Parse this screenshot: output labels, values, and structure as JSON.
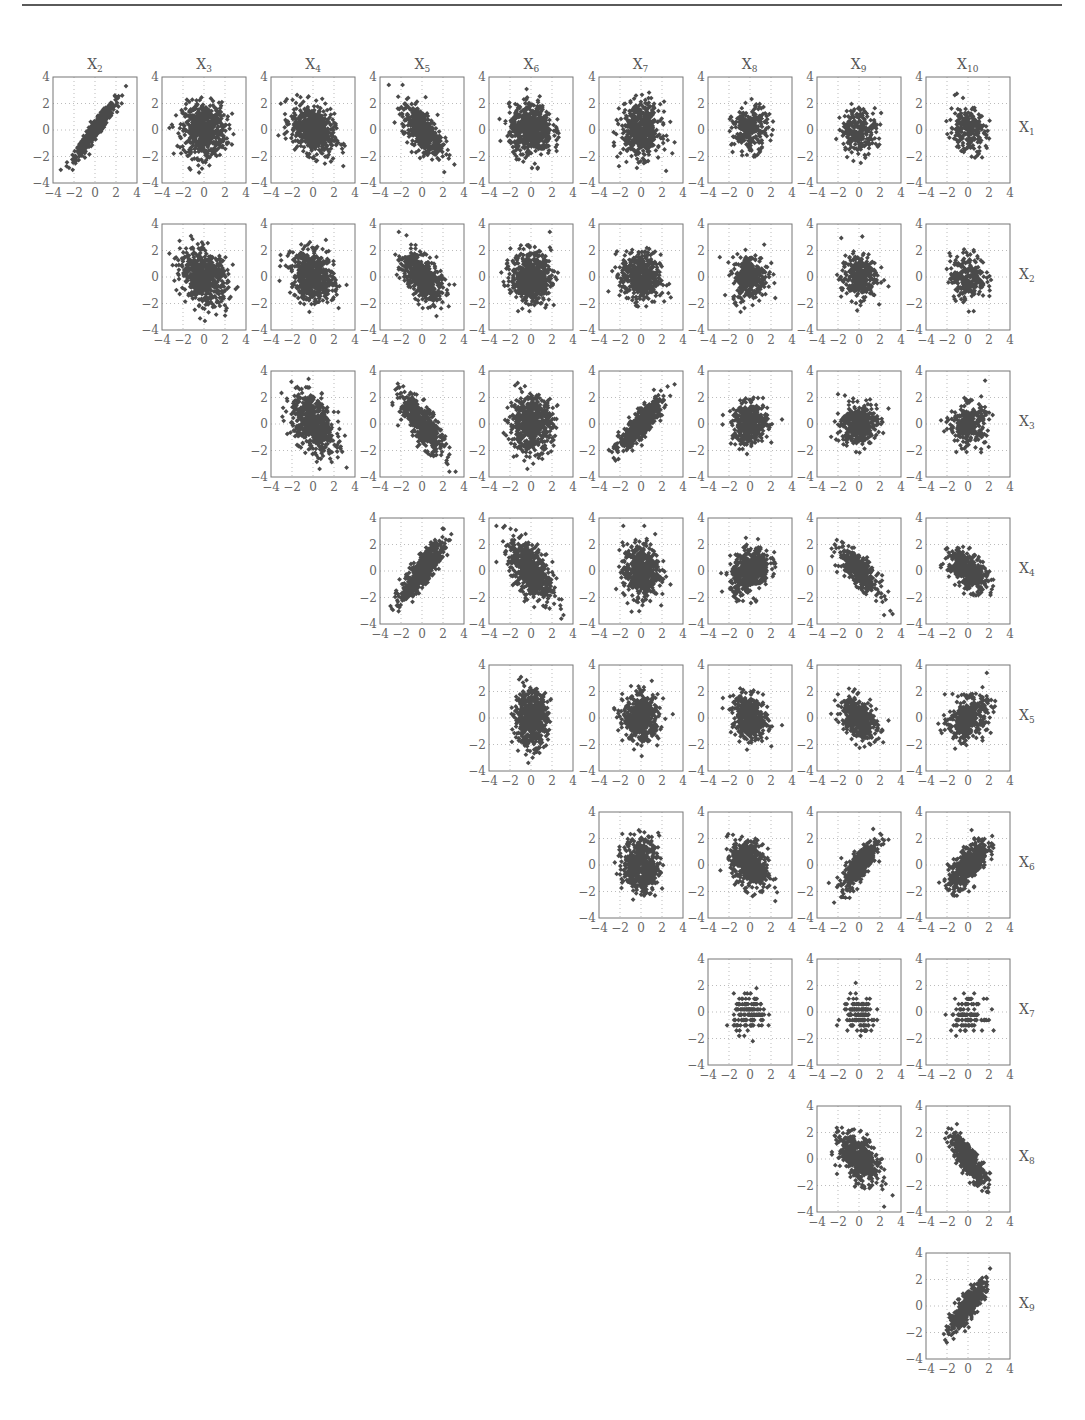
{
  "figure": {
    "type": "scatterplot-matrix",
    "column_titles": [
      {
        "base": "X",
        "sub": "2"
      },
      {
        "base": "X",
        "sub": "3"
      },
      {
        "base": "X",
        "sub": "4"
      },
      {
        "base": "X",
        "sub": "5"
      },
      {
        "base": "X",
        "sub": "6"
      },
      {
        "base": "X",
        "sub": "7"
      },
      {
        "base": "X",
        "sub": "8"
      },
      {
        "base": "X",
        "sub": "9"
      },
      {
        "base": "X",
        "sub": "10"
      }
    ],
    "row_labels": [
      {
        "base": "X",
        "sub": "1"
      },
      {
        "base": "X",
        "sub": "2"
      },
      {
        "base": "X",
        "sub": "3"
      },
      {
        "base": "X",
        "sub": "4"
      },
      {
        "base": "X",
        "sub": "5"
      },
      {
        "base": "X",
        "sub": "6"
      },
      {
        "base": "X",
        "sub": "7"
      },
      {
        "base": "X",
        "sub": "8"
      },
      {
        "base": "X",
        "sub": "9"
      }
    ],
    "axis_ticks": [
      "−4",
      "−2",
      "0",
      "2",
      "4"
    ],
    "colors": {
      "marker": "#4a4a4a",
      "frame": "#777777",
      "grid": "#bbbbbb",
      "text": "#555555",
      "rule": "#5a5a5a"
    }
  },
  "chart_data": {
    "type": "scatter",
    "title": "",
    "layout": "upper-triangular scatterplot matrix; columns X2..X10, rows X1..X9",
    "xlim": [
      -4,
      4
    ],
    "ylim": [
      -4,
      4
    ],
    "xticks": [
      -4,
      -2,
      0,
      2,
      4
    ],
    "yticks": [
      -4,
      -2,
      0,
      2,
      4
    ],
    "grid": "dotted at -2, 0, 2",
    "marker": "filled diamond",
    "panels": [
      {
        "row": "X1",
        "col": "X2",
        "r": 0.95,
        "sx": 1.1,
        "sy": 1.2,
        "n": 600,
        "note": "strong positive, wedge from (-2,-2) to (2.5,2.5)"
      },
      {
        "row": "X1",
        "col": "X3",
        "r": 0.0,
        "sx": 1.2,
        "sy": 1.2,
        "n": 600,
        "note": "dense blob, y clipped to [-2.5,2.4]"
      },
      {
        "row": "X1",
        "col": "X4",
        "r": -0.3,
        "sx": 1.2,
        "sy": 1.1,
        "n": 600,
        "note": "blob, slight negative"
      },
      {
        "row": "X1",
        "col": "X5",
        "r": -0.6,
        "sx": 1.1,
        "sy": 1.1,
        "n": 500,
        "note": "negative trend"
      },
      {
        "row": "X1",
        "col": "X6",
        "r": 0.0,
        "sx": 1.2,
        "sy": 1.1,
        "n": 600,
        "note": "round blob"
      },
      {
        "row": "X1",
        "col": "X7",
        "r": 0.0,
        "sx": 1.1,
        "sy": 1.2,
        "n": 500,
        "note": "round blob"
      },
      {
        "row": "X1",
        "col": "X8",
        "r": 0.1,
        "sx": 1.0,
        "sy": 1.0,
        "n": 250,
        "note": "sparser blob"
      },
      {
        "row": "X1",
        "col": "X9",
        "r": 0.05,
        "sx": 1.0,
        "sy": 1.0,
        "n": 250,
        "note": "sparser blob"
      },
      {
        "row": "X1",
        "col": "X10",
        "r": -0.2,
        "sx": 1.0,
        "sy": 1.0,
        "n": 250,
        "note": "sparser blob"
      },
      {
        "row": "X2",
        "col": "X3",
        "r": -0.3,
        "sx": 1.3,
        "sy": 1.2,
        "n": 600,
        "note": "triangular blob"
      },
      {
        "row": "X2",
        "col": "X4",
        "r": -0.2,
        "sx": 1.2,
        "sy": 1.1,
        "n": 600,
        "note": "blob"
      },
      {
        "row": "X2",
        "col": "X5",
        "r": -0.5,
        "sx": 1.1,
        "sy": 1.1,
        "n": 500,
        "note": "negative trend"
      },
      {
        "row": "X2",
        "col": "X6",
        "r": 0.0,
        "sx": 1.1,
        "sy": 1.1,
        "n": 600,
        "note": "round blob"
      },
      {
        "row": "X2",
        "col": "X7",
        "r": -0.1,
        "sx": 1.1,
        "sy": 1.1,
        "n": 500,
        "note": "blob"
      },
      {
        "row": "X2",
        "col": "X8",
        "r": 0.1,
        "sx": 1.0,
        "sy": 1.0,
        "n": 300,
        "note": "blob"
      },
      {
        "row": "X2",
        "col": "X9",
        "r": 0.05,
        "sx": 1.0,
        "sy": 1.0,
        "n": 300,
        "note": "blob"
      },
      {
        "row": "X2",
        "col": "X10",
        "r": 0.0,
        "sx": 1.0,
        "sy": 1.0,
        "n": 250,
        "note": "blob"
      },
      {
        "row": "X3",
        "col": "X4",
        "r": -0.45,
        "sx": 1.2,
        "sy": 1.3,
        "n": 600,
        "note": "negative trend"
      },
      {
        "row": "X3",
        "col": "X5",
        "r": -0.75,
        "sx": 1.2,
        "sy": 1.3,
        "n": 500,
        "note": "strong negative"
      },
      {
        "row": "X3",
        "col": "X6",
        "r": 0.0,
        "sx": 1.2,
        "sy": 1.2,
        "n": 600,
        "note": "round blob"
      },
      {
        "row": "X3",
        "col": "X7",
        "r": 0.85,
        "sx": 1.2,
        "sy": 1.1,
        "n": 600,
        "note": "strong positive"
      },
      {
        "row": "X3",
        "col": "X8",
        "r": 0.1,
        "sx": 1.0,
        "sy": 0.9,
        "n": 400,
        "note": "blob, floor at -1.8"
      },
      {
        "row": "X3",
        "col": "X9",
        "r": 0.1,
        "sx": 1.0,
        "sy": 0.9,
        "n": 400,
        "note": "triangular blob"
      },
      {
        "row": "X3",
        "col": "X10",
        "r": 0.0,
        "sx": 1.0,
        "sy": 0.9,
        "n": 300,
        "note": "blob"
      },
      {
        "row": "X4",
        "col": "X5",
        "r": 0.85,
        "sx": 1.2,
        "sy": 1.3,
        "n": 600,
        "note": "curved positive"
      },
      {
        "row": "X4",
        "col": "X6",
        "r": -0.55,
        "sx": 1.2,
        "sy": 1.4,
        "n": 600,
        "note": "negative trend"
      },
      {
        "row": "X4",
        "col": "X7",
        "r": 0.0,
        "sx": 1.0,
        "sy": 1.2,
        "n": 500,
        "note": "blob"
      },
      {
        "row": "X4",
        "col": "X8",
        "r": 0.35,
        "sx": 1.1,
        "sy": 1.0,
        "n": 500,
        "note": "slight positive"
      },
      {
        "row": "X4",
        "col": "X9",
        "r": -0.75,
        "sx": 1.1,
        "sy": 1.0,
        "n": 400,
        "note": "negative trend"
      },
      {
        "row": "X4",
        "col": "X10",
        "r": -0.5,
        "sx": 1.1,
        "sy": 0.9,
        "n": 400,
        "note": "negative trend"
      },
      {
        "row": "X5",
        "col": "X6",
        "r": 0.0,
        "sx": 0.9,
        "sy": 1.2,
        "n": 600,
        "note": "vertical blob"
      },
      {
        "row": "X5",
        "col": "X7",
        "r": 0.0,
        "sx": 1.0,
        "sy": 1.0,
        "n": 500,
        "note": "blob"
      },
      {
        "row": "X5",
        "col": "X8",
        "r": -0.2,
        "sx": 1.0,
        "sy": 1.0,
        "n": 400,
        "note": "blob"
      },
      {
        "row": "X5",
        "col": "X9",
        "r": -0.4,
        "sx": 1.0,
        "sy": 1.0,
        "n": 400,
        "note": "blob"
      },
      {
        "row": "X5",
        "col": "X10",
        "r": 0.3,
        "sx": 1.1,
        "sy": 0.9,
        "n": 400,
        "note": "slight positive"
      },
      {
        "row": "X6",
        "col": "X7",
        "r": 0.0,
        "sx": 1.0,
        "sy": 1.2,
        "n": 500,
        "note": "blob"
      },
      {
        "row": "X6",
        "col": "X8",
        "r": -0.3,
        "sx": 1.0,
        "sy": 1.1,
        "n": 500,
        "note": "blob"
      },
      {
        "row": "X6",
        "col": "X9",
        "r": 0.8,
        "sx": 1.0,
        "sy": 1.1,
        "n": 400,
        "note": "strong positive"
      },
      {
        "row": "X6",
        "col": "X10",
        "r": 0.7,
        "sx": 1.1,
        "sy": 1.1,
        "n": 500,
        "note": "positive"
      },
      {
        "row": "X7",
        "col": "X8",
        "r": 0.0,
        "sx": 0.9,
        "sy": 0.8,
        "n": 150,
        "note": "banded (discrete y levels)"
      },
      {
        "row": "X7",
        "col": "X9",
        "r": 0.0,
        "sx": 0.9,
        "sy": 0.8,
        "n": 150,
        "note": "banded (discrete y levels)"
      },
      {
        "row": "X7",
        "col": "X10",
        "r": 0.0,
        "sx": 0.9,
        "sy": 0.7,
        "n": 120,
        "note": "banded (discrete y levels)"
      },
      {
        "row": "X8",
        "col": "X9",
        "r": -0.5,
        "sx": 1.1,
        "sy": 1.1,
        "n": 500,
        "note": "negative"
      },
      {
        "row": "X8",
        "col": "X10",
        "r": -0.8,
        "sx": 1.0,
        "sy": 1.1,
        "n": 450,
        "note": "strong negative"
      },
      {
        "row": "X9",
        "col": "X10",
        "r": 0.85,
        "sx": 1.0,
        "sy": 1.1,
        "n": 500,
        "note": "strong positive wedge"
      }
    ]
  }
}
